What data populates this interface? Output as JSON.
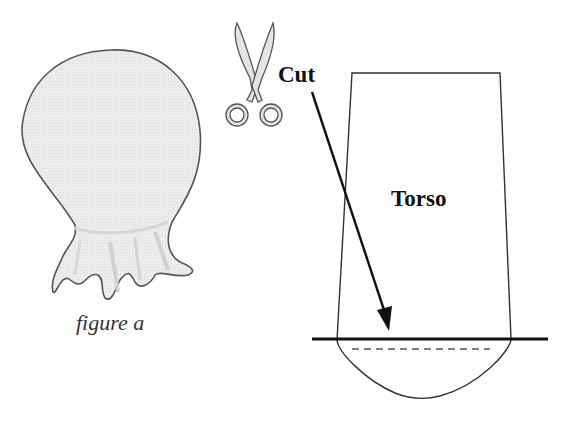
{
  "figure_a": {
    "caption": "figure a",
    "fill_color": "#e9e9e9",
    "outline_color": "#555555"
  },
  "scissors": {
    "icon": "scissors-icon",
    "fill_color": "#e4e4e4",
    "outline_color": "#555555"
  },
  "torso_pattern": {
    "title": "Torso",
    "cut_label": "Cut",
    "outline_color": "#333333",
    "cut_line_color": "#111111",
    "seam_line_style": "dashed"
  }
}
